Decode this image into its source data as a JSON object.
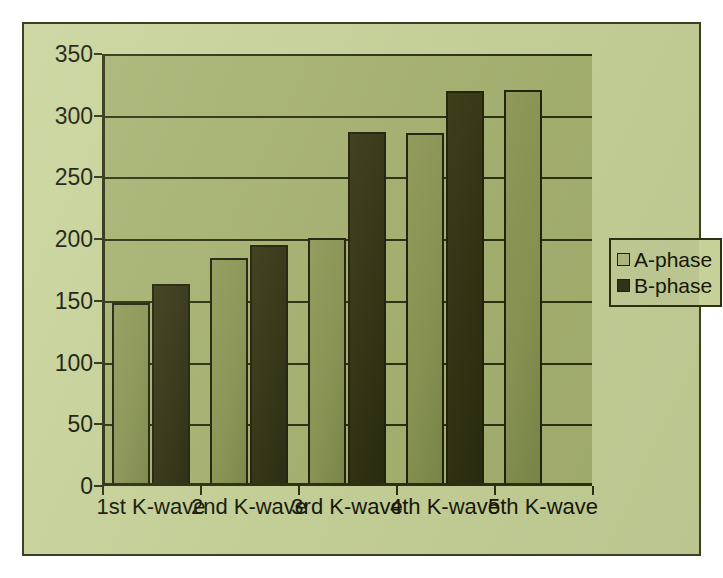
{
  "chart_data": {
    "type": "bar",
    "title": "",
    "xlabel": "",
    "ylabel": "",
    "categories": [
      "1st K-wave",
      "2nd K-wave",
      "3rd K-wave",
      "4th K-wave",
      "5th K-wave"
    ],
    "series": [
      {
        "name": "A-phase",
        "color": "#8c9755",
        "values": [
          148,
          185,
          201,
          286,
          321
        ]
      },
      {
        "name": "B-phase",
        "color": "#35341a",
        "values": [
          164,
          195,
          287,
          320,
          null
        ]
      }
    ],
    "ylim": [
      0,
      350
    ],
    "yticks": [
      0,
      50,
      100,
      150,
      200,
      250,
      300,
      350
    ],
    "ytick_labels": [
      "0",
      "50",
      "100",
      "150",
      "200",
      "250",
      "300",
      "350"
    ],
    "grid": true,
    "legend_position": "right",
    "legend_entries": [
      "A-phase",
      "B-phase"
    ]
  },
  "figure": {
    "canvas_color": "#c9d49a",
    "plot_background_color": "#a8b472",
    "border_color": "#3d3f22",
    "axis_color": "#2f3114",
    "text_color": "#17180a"
  }
}
